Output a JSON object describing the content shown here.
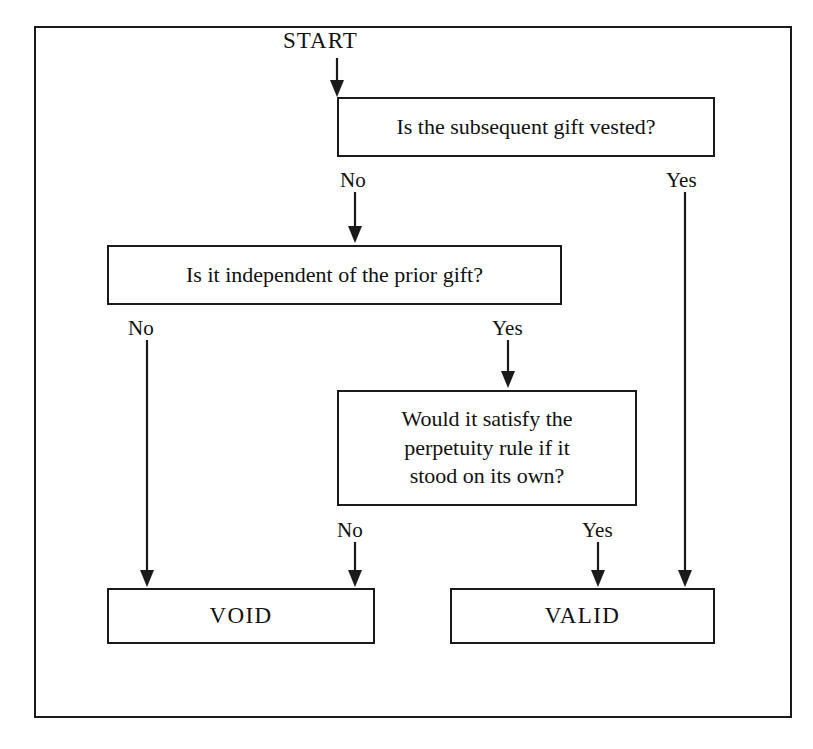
{
  "diagram": {
    "start_label": "START",
    "ink_color": "#1a1a1a",
    "background_color": "#ffffff"
  },
  "nodes": [
    {
      "id": "q1",
      "kind": "question",
      "text": "Is the subsequent gift vested?",
      "x": 337,
      "y": 97,
      "w": 378,
      "h": 60
    },
    {
      "id": "q2",
      "kind": "question",
      "text": "Is it independent of the prior gift?",
      "x": 107,
      "y": 245,
      "w": 455,
      "h": 60
    },
    {
      "id": "q3",
      "kind": "question-multi",
      "line1": "Would it satisfy the",
      "line2": "perpetuity rule if it",
      "line3": "stood on its own?",
      "x": 337,
      "y": 390,
      "w": 300,
      "h": 116
    },
    {
      "id": "void",
      "kind": "terminal",
      "text": "VOID",
      "x": 107,
      "y": 588,
      "w": 268,
      "h": 56
    },
    {
      "id": "valid",
      "kind": "terminal",
      "text": "VALID",
      "x": 450,
      "y": 588,
      "w": 265,
      "h": 56
    }
  ],
  "branch_labels": [
    {
      "id": "q1-no",
      "text": "No",
      "x": 340,
      "y": 168
    },
    {
      "id": "q1-yes",
      "text": "Yes",
      "x": 666,
      "y": 168
    },
    {
      "id": "q2-no",
      "text": "No",
      "x": 128,
      "y": 316
    },
    {
      "id": "q2-yes",
      "text": "Yes",
      "x": 492,
      "y": 316
    },
    {
      "id": "q3-no",
      "text": "No",
      "x": 337,
      "y": 518
    },
    {
      "id": "q3-yes",
      "text": "Yes",
      "x": 582,
      "y": 518
    }
  ],
  "edges": [
    {
      "id": "start-to-q1",
      "from": "START",
      "to": "q1",
      "label": ""
    },
    {
      "id": "q1-no-q2",
      "from": "q1",
      "to": "q2",
      "label": "No"
    },
    {
      "id": "q1-yes-valid",
      "from": "q1",
      "to": "valid",
      "label": "Yes"
    },
    {
      "id": "q2-no-void",
      "from": "q2",
      "to": "void",
      "label": "No"
    },
    {
      "id": "q2-yes-q3",
      "from": "q2",
      "to": "q3",
      "label": "Yes"
    },
    {
      "id": "q3-no-void",
      "from": "q3",
      "to": "void",
      "label": "No"
    },
    {
      "id": "q3-yes-valid",
      "from": "q3",
      "to": "valid",
      "label": "Yes"
    }
  ]
}
